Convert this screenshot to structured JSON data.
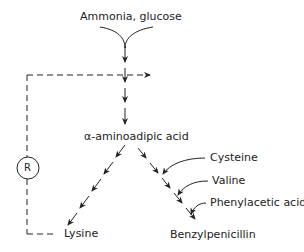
{
  "diagram": {
    "inputs": "Ammonia, glucose",
    "intermediate": "α-aminoadipic acid",
    "regulator": "R",
    "products": {
      "lysine": "Lysine",
      "penicillin": "Benzylpenicillin"
    },
    "precursors": [
      "Cysteine",
      "Valine",
      "Phenylacetic acid"
    ],
    "colors": {
      "line": "#222222",
      "background": "#ffffff"
    }
  }
}
